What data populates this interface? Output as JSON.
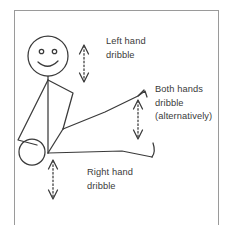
{
  "diagram": {
    "background_color": "#ffffff",
    "ink_color": "#3a3a3a",
    "frame": {
      "x": 14,
      "y": 10,
      "width": 205,
      "height": 218,
      "stroke": "#9a9a9a"
    },
    "labels": {
      "left_hand": {
        "line1": "Left hand",
        "line2": "dribble"
      },
      "both_hands": {
        "line1": "Both hands",
        "line2": "dribble",
        "line3": "(alternatively)"
      },
      "right_hand": {
        "line1": "Right hand",
        "line2": "dribble"
      }
    },
    "arrows": [
      {
        "name": "left-hand-dribble-arrow",
        "x": 84,
        "y_top": 45,
        "y_bottom": 82,
        "style": "dotted",
        "heads": "both"
      },
      {
        "name": "both-hands-dribble-arrow",
        "x": 138,
        "y_top": 100,
        "y_bottom": 139,
        "style": "dotted",
        "heads": "both"
      },
      {
        "name": "right-hand-dribble-arrow",
        "x": 53,
        "y_top": 160,
        "y_bottom": 199,
        "style": "dotted",
        "heads": "both"
      }
    ],
    "figure": {
      "head": {
        "cx": 48,
        "cy": 56,
        "r": 20
      },
      "eyes": [
        {
          "cx": 42,
          "cy": 52,
          "r": 2.1
        },
        {
          "cx": 55,
          "cy": 52,
          "r": 2.1
        }
      ],
      "mouth": "smile",
      "ball": {
        "cx": 32,
        "cy": 152,
        "r": 13
      },
      "torso": "vertical",
      "arms": "both-extended"
    }
  }
}
